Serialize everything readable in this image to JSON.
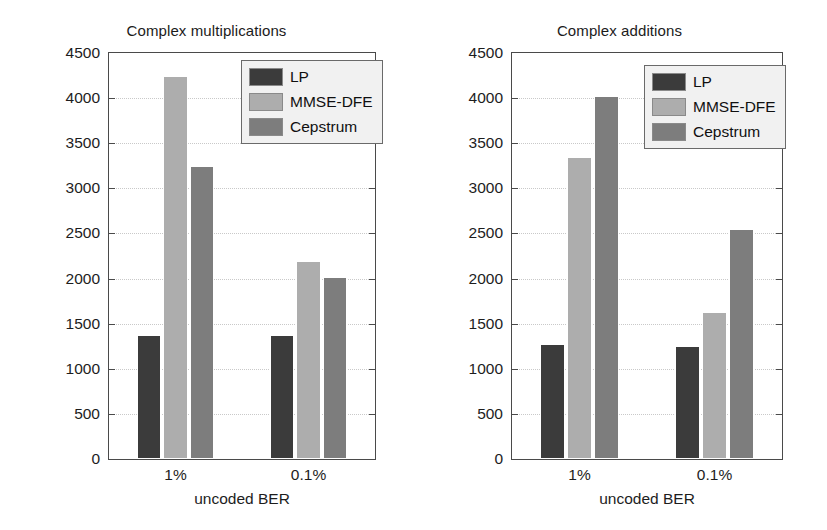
{
  "figure": {
    "background": "#ffffff",
    "panel_count": 2
  },
  "colors": {
    "lp": "#3b3b3b",
    "mmse_dfe": "#adadad",
    "cepstrum": "#7d7d7d",
    "axis": "#4a4a4a",
    "grid": "#c9c9c9",
    "legend_background": "#f1f1f1",
    "text": "#1d1d1d"
  },
  "series_names": {
    "lp": "LP",
    "mmse_dfe": "MMSE-DFE",
    "cepstrum": "Cepstrum"
  },
  "axis": {
    "ticks": [
      "0",
      "500",
      "1000",
      "1500",
      "2000",
      "2500",
      "3000",
      "3500",
      "4000",
      "4500"
    ],
    "tick_values": [
      0,
      500,
      1000,
      1500,
      2000,
      2500,
      3000,
      3500,
      4000,
      4500
    ],
    "ymin": 0,
    "ymax": 4500,
    "xlabel": "uncoded BER",
    "categories": [
      "1%",
      "0.1%"
    ]
  },
  "chart_data": [
    {
      "type": "bar",
      "title": "Complex multiplications",
      "xlabel": "uncoded BER",
      "ylabel": "",
      "categories": [
        "1%",
        "0.1%"
      ],
      "ylim": [
        0,
        4500
      ],
      "yticks": [
        0,
        500,
        1000,
        1500,
        2000,
        2500,
        3000,
        3500,
        4000,
        4500
      ],
      "grid": true,
      "legend_position": "top-right",
      "series": [
        {
          "name": "LP",
          "color": "#3b3b3b",
          "values": [
            1380,
            1370
          ]
        },
        {
          "name": "MMSE-DFE",
          "color": "#adadad",
          "values": [
            4250,
            2200
          ]
        },
        {
          "name": "Cepstrum",
          "color": "#7d7d7d",
          "values": [
            3250,
            2020
          ]
        }
      ]
    },
    {
      "type": "bar",
      "title": "Complex additions",
      "xlabel": "uncoded BER",
      "ylabel": "",
      "categories": [
        "1%",
        "0.1%"
      ],
      "ylim": [
        0,
        4500
      ],
      "yticks": [
        0,
        500,
        1000,
        1500,
        2000,
        2500,
        3000,
        3500,
        4000,
        4500
      ],
      "grid": true,
      "legend_position": "top-right",
      "series": [
        {
          "name": "LP",
          "color": "#3b3b3b",
          "values": [
            1270,
            1250
          ]
        },
        {
          "name": "MMSE-DFE",
          "color": "#adadad",
          "values": [
            3350,
            1630
          ]
        },
        {
          "name": "Cepstrum",
          "color": "#7d7d7d",
          "values": [
            4020,
            2550
          ]
        }
      ]
    }
  ]
}
